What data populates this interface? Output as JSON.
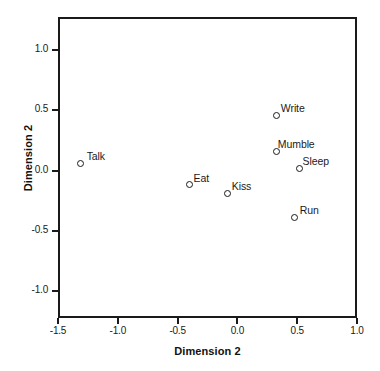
{
  "chart_data": {
    "type": "scatter",
    "title": "",
    "xlabel": "Dimension 2",
    "ylabel": "Dimension 2",
    "xlim": [
      -1.5,
      1.0
    ],
    "ylim": [
      -1.25,
      1.25
    ],
    "xticks": [
      "-1.5",
      "-1.0",
      "-0.5",
      "0.0",
      "0.5",
      "1.0"
    ],
    "xtick_values": [
      -1.5,
      -1.0,
      -0.5,
      0.0,
      0.5,
      1.0
    ],
    "yticks": [
      "-1.0",
      "-0.5",
      "0.0",
      "0.5",
      "1.0"
    ],
    "ytick_values": [
      -1.0,
      -0.5,
      0.0,
      0.5,
      1.0
    ],
    "grid": false,
    "legend": false,
    "marker": "open-circle",
    "points": [
      {
        "label": "Talk",
        "x": -1.31,
        "y": 0.06,
        "label_dx": 6,
        "label_dy": -13
      },
      {
        "label": "Eat",
        "x": -0.4,
        "y": -0.12,
        "label_dx": 4,
        "label_dy": -13
      },
      {
        "label": "Kiss",
        "x": -0.08,
        "y": -0.19,
        "label_dx": 4,
        "label_dy": -13
      },
      {
        "label": "Write",
        "x": 0.33,
        "y": 0.46,
        "label_dx": 4,
        "label_dy": -13
      },
      {
        "label": "Mumble",
        "x": 0.33,
        "y": 0.16,
        "label_dx": 1,
        "label_dy": -13
      },
      {
        "label": "Sleep",
        "x": 0.52,
        "y": 0.02,
        "label_dx": 3,
        "label_dy": -13
      },
      {
        "label": "Run",
        "x": 0.48,
        "y": -0.39,
        "label_dx": 5,
        "label_dy": -13
      }
    ]
  },
  "axes": {
    "plot_left_px": 58,
    "plot_top_px": 17,
    "plot_width_px": 299,
    "plot_height_px": 301,
    "x_origin_px": 58,
    "x_scale_px_per_unit": 119.6,
    "y_zero_px": 170.5,
    "y_scale_px_per_unit": 120.5
  }
}
